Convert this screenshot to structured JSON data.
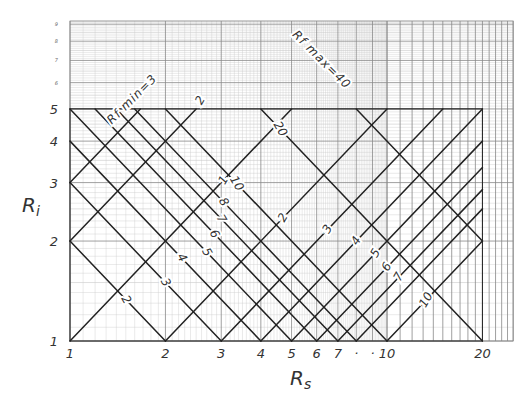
{
  "chart_data": {
    "type": "line",
    "title": "",
    "xlabel": "Rs",
    "ylabel": "Ri",
    "xscale": "log",
    "yscale": "log",
    "xlim": [
      1,
      25
    ],
    "ylim": [
      1,
      9.2
    ],
    "grid": true,
    "x_ticks": [
      {
        "value": 1,
        "label": "1"
      },
      {
        "value": 2,
        "label": "2"
      },
      {
        "value": 3,
        "label": "3"
      },
      {
        "value": 4,
        "label": "4"
      },
      {
        "value": 5,
        "label": "5"
      },
      {
        "value": 6,
        "label": "6"
      },
      {
        "value": 7,
        "label": "7"
      },
      {
        "value": 8,
        "label": "·"
      },
      {
        "value": 9,
        "label": "·"
      },
      {
        "value": 10,
        "label": "10"
      },
      {
        "value": 20,
        "label": "20"
      }
    ],
    "y_ticks": [
      {
        "value": 1,
        "label": "1"
      },
      {
        "value": 2,
        "label": "2"
      },
      {
        "value": 3,
        "label": "3"
      },
      {
        "value": 4,
        "label": "4"
      },
      {
        "value": 5,
        "label": "5"
      }
    ],
    "y_minor_ticks": [
      {
        "value": 6,
        "label": "6"
      },
      {
        "value": 7,
        "label": "7"
      },
      {
        "value": 8,
        "label": "8"
      },
      {
        "value": 9,
        "label": "9"
      }
    ],
    "series_descending": {
      "description": "Lines of constant product Rs·Ri (slope −1 on log-log)",
      "lines": [
        {
          "product": 2,
          "from": [
            1,
            2
          ],
          "to": [
            2,
            1
          ],
          "label": "2",
          "label_at": [
            1.5,
            1.33
          ]
        },
        {
          "product": 3,
          "from": [
            1,
            3
          ],
          "to": [
            3,
            1
          ],
          "label": "3",
          "label_at": [
            2,
            1.5
          ]
        },
        {
          "product": 4,
          "from": [
            1,
            4
          ],
          "to": [
            4,
            1
          ],
          "label": "4",
          "label_at": [
            2.25,
            1.78
          ]
        },
        {
          "product": 5,
          "from": [
            1,
            5
          ],
          "to": [
            5,
            1
          ],
          "label": "5",
          "label_at": [
            2.7,
            1.85
          ]
        },
        {
          "product": 6,
          "from": [
            1.2,
            5
          ],
          "to": [
            6,
            1
          ],
          "label": "6",
          "label_at": [
            2.85,
            2.1
          ]
        },
        {
          "product": 7,
          "from": [
            1.4,
            5
          ],
          "to": [
            7,
            1
          ],
          "label": "7",
          "label_at": [
            3.0,
            2.33
          ]
        },
        {
          "product": 8,
          "from": [
            1.6,
            5
          ],
          "to": [
            8,
            1
          ],
          "label": "8",
          "label_at": [
            3.05,
            2.62
          ]
        },
        {
          "product": 10,
          "from": [
            2,
            5
          ],
          "to": [
            10,
            1
          ],
          "label": "10",
          "label_at": [
            3.35,
            2.98
          ]
        },
        {
          "product": 20,
          "from": [
            4,
            5
          ],
          "to": [
            20,
            1
          ],
          "label": "20",
          "label_at": [
            4.6,
            4.35
          ]
        },
        {
          "product": 40,
          "from": [
            8,
            5
          ],
          "to": [
            20,
            2
          ],
          "label": "",
          "label_at": null
        }
      ]
    },
    "series_ascending": {
      "description": "Lines of constant ratio (slope +1 on log-log)",
      "lines": [
        {
          "ratio_label": "Rf min=3",
          "from": [
            1,
            3
          ],
          "to": [
            1.667,
            5
          ]
        },
        {
          "ratio_label": "2",
          "from": [
            1,
            2
          ],
          "to": [
            2.5,
            5
          ],
          "label_at": [
            2.58,
            5.3
          ]
        },
        {
          "ratio_label": "1",
          "from": [
            1,
            1
          ],
          "to": [
            5,
            5
          ],
          "label_at": [
            3.05,
            3.05
          ]
        },
        {
          "ratio_label": "2",
          "from": [
            2,
            1
          ],
          "to": [
            10,
            5
          ],
          "label_at": [
            4.7,
            2.35
          ]
        },
        {
          "ratio_label": "3",
          "from": [
            3,
            1
          ],
          "to": [
            15,
            5
          ],
          "label_at": [
            6.5,
            2.17
          ]
        },
        {
          "ratio_label": "4",
          "from": [
            4,
            1
          ],
          "to": [
            20,
            5
          ],
          "label_at": [
            8.0,
            2.0
          ]
        },
        {
          "ratio_label": "5",
          "from": [
            5,
            1
          ],
          "to": [
            20,
            4
          ],
          "label_at": [
            9.2,
            1.84
          ]
        },
        {
          "ratio_label": "6",
          "from": [
            6,
            1
          ],
          "to": [
            20,
            3.333
          ],
          "label_at": [
            10.0,
            1.67
          ]
        },
        {
          "ratio_label": "7",
          "from": [
            7,
            1
          ],
          "to": [
            20,
            2.857
          ],
          "label_at": [
            10.9,
            1.56
          ]
        },
        {
          "ratio_label": "8",
          "from": [
            8,
            1
          ],
          "to": [
            20,
            2.5
          ],
          "label_at": null
        },
        {
          "ratio_label": "10",
          "from": [
            10,
            1
          ],
          "to": [
            20,
            2
          ],
          "label_at": [
            13.3,
            1.33
          ]
        }
      ]
    },
    "top_boundary": {
      "y": 5,
      "from_x": 1,
      "to_x": 20
    },
    "annotations": [
      {
        "text": "Rf min=3",
        "at": [
          1.6,
          5.25
        ],
        "angle": -45
      },
      {
        "text": "Rf max=40",
        "at": [
          6.1,
          6.9
        ],
        "angle": 45
      }
    ]
  },
  "colors": {
    "ink": "#222222",
    "grid_major": "#888888",
    "grid_minor": "#c9c9c9",
    "label": "#333333"
  }
}
